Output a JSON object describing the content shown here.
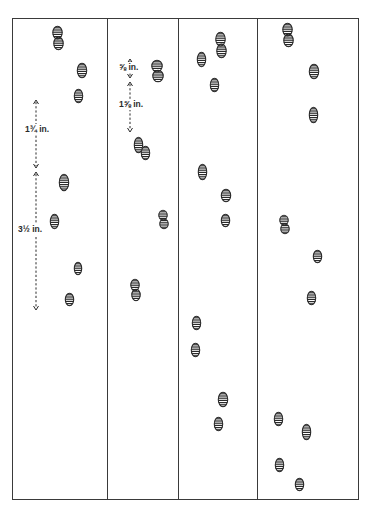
{
  "figure": {
    "type": "animal track diagram",
    "frame": {
      "left": 12,
      "top": 18,
      "right": 359,
      "bottom": 500,
      "stroke": "#3a3a3a"
    },
    "dividers_x": [
      107,
      178,
      257
    ],
    "colors": {
      "ink": "#2a2a2a",
      "paper": "#ffffff"
    },
    "panels": [
      {
        "id": "panel-1",
        "prints": [
          {
            "x": 58,
            "y": 38,
            "w": 10,
            "h": 24
          },
          {
            "x": 82,
            "y": 70,
            "w": 10,
            "h": 15
          },
          {
            "x": 78,
            "y": 96,
            "w": 9,
            "h": 14
          },
          {
            "x": 64,
            "y": 182,
            "w": 10,
            "h": 17
          },
          {
            "x": 54,
            "y": 221,
            "w": 9,
            "h": 15
          },
          {
            "x": 78,
            "y": 268,
            "w": 8,
            "h": 13
          },
          {
            "x": 69,
            "y": 299,
            "w": 9,
            "h": 13
          }
        ],
        "measurements": [
          {
            "label": "1¾ in.",
            "x": 36,
            "y1": 100,
            "y2": 168,
            "label_x": 24,
            "label_y": 129
          },
          {
            "label": "3½ in.",
            "x": 36,
            "y1": 172,
            "y2": 310,
            "label_x": 17,
            "label_y": 229
          }
        ]
      },
      {
        "id": "panel-2",
        "prints": [
          {
            "x": 157,
            "y": 71,
            "w": 11,
            "h": 22
          },
          {
            "x": 138,
            "y": 145,
            "w": 9,
            "h": 16
          },
          {
            "x": 145,
            "y": 153,
            "w": 9,
            "h": 14
          },
          {
            "x": 163,
            "y": 219,
            "w": 9,
            "h": 19
          },
          {
            "x": 135,
            "y": 290,
            "w": 9,
            "h": 22
          }
        ],
        "measurements": [
          {
            "label": "⅝ in.",
            "x": 130,
            "y1": 59,
            "y2": 78,
            "label_x": 118,
            "label_y": 67
          },
          {
            "label": "1⅝ in.",
            "x": 130,
            "y1": 82,
            "y2": 132,
            "label_x": 118,
            "label_y": 104
          }
        ]
      },
      {
        "id": "panel-3",
        "prints": [
          {
            "x": 221,
            "y": 45,
            "w": 10,
            "h": 26
          },
          {
            "x": 201,
            "y": 59,
            "w": 9,
            "h": 15
          },
          {
            "x": 214,
            "y": 85,
            "w": 9,
            "h": 14
          },
          {
            "x": 202,
            "y": 172,
            "w": 9,
            "h": 16
          },
          {
            "x": 226,
            "y": 195,
            "w": 10,
            "h": 13
          },
          {
            "x": 225,
            "y": 220,
            "w": 9,
            "h": 13
          },
          {
            "x": 196,
            "y": 323,
            "w": 9,
            "h": 14
          },
          {
            "x": 195,
            "y": 350,
            "w": 9,
            "h": 14
          },
          {
            "x": 223,
            "y": 399,
            "w": 10,
            "h": 15
          },
          {
            "x": 218,
            "y": 424,
            "w": 9,
            "h": 14
          }
        ],
        "measurements": []
      },
      {
        "id": "panel-4",
        "prints": [
          {
            "x": 288,
            "y": 35,
            "w": 10,
            "h": 24
          },
          {
            "x": 314,
            "y": 71,
            "w": 10,
            "h": 15
          },
          {
            "x": 313,
            "y": 115,
            "w": 9,
            "h": 16
          },
          {
            "x": 284,
            "y": 224,
            "w": 9,
            "h": 19
          },
          {
            "x": 317,
            "y": 256,
            "w": 9,
            "h": 13
          },
          {
            "x": 311,
            "y": 298,
            "w": 9,
            "h": 14
          },
          {
            "x": 278,
            "y": 419,
            "w": 9,
            "h": 14
          },
          {
            "x": 306,
            "y": 432,
            "w": 9,
            "h": 16
          },
          {
            "x": 279,
            "y": 465,
            "w": 9,
            "h": 14
          },
          {
            "x": 299,
            "y": 484,
            "w": 9,
            "h": 13
          }
        ],
        "measurements": []
      }
    ]
  }
}
